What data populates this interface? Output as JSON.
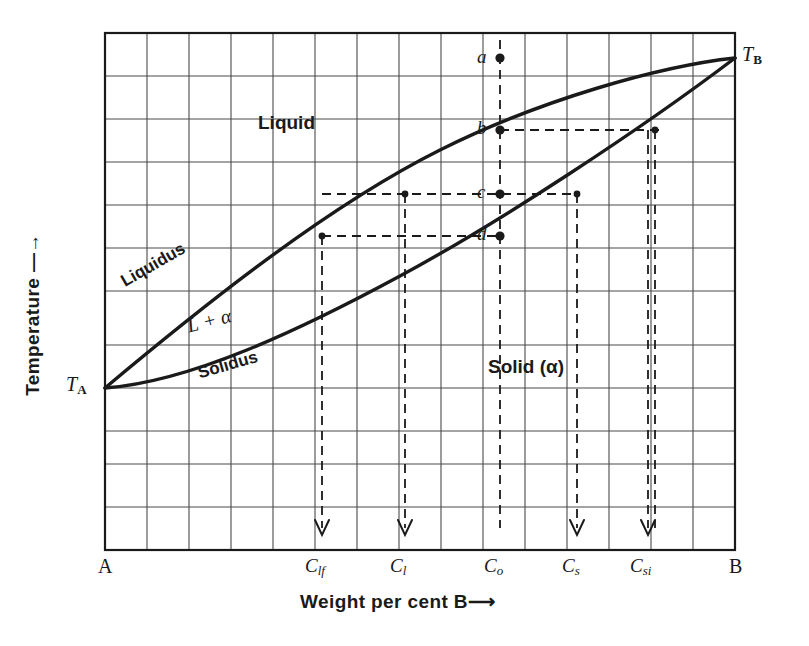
{
  "figure": {
    "type": "binary-phase-diagram",
    "axis": {
      "y_label": "Temperature —→",
      "x_label": "Weight per cent B⟶",
      "x_start_label": "A",
      "x_end_label": "B",
      "y_start_label": "T",
      "y_start_sub": "A",
      "y_end_label": "T",
      "y_end_sub": "B"
    },
    "regions": [
      {
        "id": "liquid",
        "label": "Liquid"
      },
      {
        "id": "two-phase",
        "label": "L + α"
      },
      {
        "id": "solid",
        "label": "Solid (α)"
      }
    ],
    "curves": [
      {
        "id": "liquidus",
        "label": "Liquidus"
      },
      {
        "id": "solidus",
        "label": "Solidus"
      }
    ],
    "points": [
      {
        "id": "a",
        "label": "a",
        "x": 500,
        "y": 58
      },
      {
        "id": "b",
        "label": "b",
        "x": 500,
        "y": 130
      },
      {
        "id": "c",
        "label": "c",
        "x": 500,
        "y": 194
      },
      {
        "id": "d",
        "label": "d",
        "x": 500,
        "y": 236
      }
    ],
    "composition_ticks": [
      {
        "id": "clf",
        "base": "C",
        "sub": "lf",
        "x": 322
      },
      {
        "id": "cl",
        "base": "C",
        "sub": "l",
        "x": 405
      },
      {
        "id": "co",
        "base": "C",
        "sub": "o",
        "x": 500
      },
      {
        "id": "cs",
        "base": "C",
        "sub": "s",
        "x": 577
      },
      {
        "id": "csi",
        "base": "C",
        "sub": "si",
        "x": 648
      }
    ],
    "colors": {
      "ink": "#1a1a1a",
      "grid": "#4a4a4a",
      "curve": "#1a1a1a",
      "background": "#ffffff"
    },
    "grid": {
      "left": 105,
      "right": 735,
      "top": 33,
      "bottom": 550,
      "columns": 15,
      "rows": 12
    }
  }
}
